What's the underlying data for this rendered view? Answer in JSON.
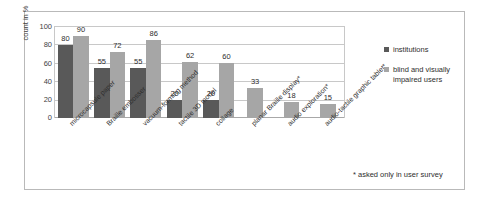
{
  "chart_data": {
    "type": "bar",
    "title": "",
    "xlabel": "",
    "ylabel": "count in %",
    "ylim": [
      0,
      100
    ],
    "yticks": [
      0,
      20,
      40,
      60,
      80,
      100
    ],
    "grid": true,
    "legend_position": "right",
    "categories": [
      "microcapsule paper",
      "Braille embosser",
      "vacuum-forming method",
      "tactile 3D model",
      "collage",
      "planar Braille display*",
      "audio exploration*",
      "audio-tactile graphic tablet*"
    ],
    "series": [
      {
        "name": "institutions",
        "color": "#595959",
        "values": [
          80,
          55,
          55,
          20,
          20,
          null,
          null,
          null
        ]
      },
      {
        "name": "blind and visually impaired users",
        "color": "#a6a6a6",
        "values": [
          90,
          72,
          86,
          62,
          60,
          33,
          18,
          15
        ]
      }
    ],
    "annotations": [
      "* asked only in user survey"
    ]
  },
  "legend": {
    "items": [
      {
        "label": "institutions",
        "color": "#595959"
      },
      {
        "label": "blind and visually impaired users",
        "color": "#a6a6a6"
      }
    ]
  },
  "axis": {
    "y_title": "count in %",
    "y_ticks": [
      "100",
      "80",
      "60",
      "40",
      "20",
      "0"
    ]
  },
  "footnote": {
    "text": "* asked only in user survey"
  },
  "colors": {
    "institutions": "#595959",
    "users": "#a6a6a6",
    "grid": "#c8c8c8",
    "frame": "#b9b9b9",
    "text": "#2e2e2e"
  }
}
